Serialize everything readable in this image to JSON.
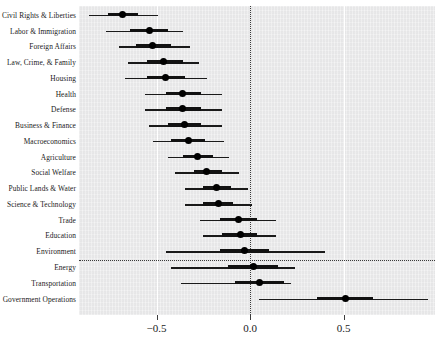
{
  "chart_data": {
    "type": "scatter",
    "plot_style": "coefficient-plot-with-confidence-intervals",
    "title": "",
    "subtitle": "",
    "xlabel": "",
    "ylabel": "",
    "xlim": [
      -0.75,
      0.98
    ],
    "xticks": [
      -0.5,
      0.0,
      0.5
    ],
    "xticklabels": [
      "−0.5",
      "0.0",
      "0.5"
    ],
    "grid": {
      "vertical_white_gridlines": true,
      "zero_reference_line": "dotted"
    },
    "legend": {
      "visible": false
    },
    "annotations": [
      {
        "type": "hline",
        "style": "dotted",
        "between": [
          "Environment",
          "Energy"
        ]
      }
    ],
    "panel_background": "#ececed",
    "point_color": "#000000",
    "line_color": "#1a1a1a",
    "categories": [
      "Civil Rights & Liberties",
      "Labor & Immigration",
      "Foreign Affairs",
      "Law, Crime, & Family",
      "Housing",
      "Health",
      "Defense",
      "Business & Finance",
      "Macroeconomics",
      "Agriculture",
      "Social Welfare",
      "Public Lands & Water",
      "Science & Technology",
      "Trade",
      "Education",
      "Environment",
      "Energy",
      "Transportation",
      "Government Operations"
    ],
    "values": [
      -0.68,
      -0.54,
      -0.52,
      -0.46,
      -0.45,
      -0.36,
      -0.36,
      -0.35,
      -0.33,
      -0.28,
      -0.23,
      -0.18,
      -0.17,
      -0.06,
      -0.05,
      -0.03,
      0.02,
      0.05,
      0.51
    ],
    "ci_outer_low": [
      -0.86,
      -0.77,
      -0.7,
      -0.65,
      -0.67,
      -0.56,
      -0.56,
      -0.54,
      -0.52,
      -0.44,
      -0.4,
      -0.35,
      -0.35,
      -0.27,
      -0.25,
      -0.45,
      -0.42,
      -0.37,
      0.05
    ],
    "ci_outer_high": [
      -0.49,
      -0.36,
      -0.32,
      -0.27,
      -0.23,
      -0.15,
      -0.15,
      -0.15,
      -0.14,
      -0.11,
      -0.06,
      -0.01,
      0.01,
      0.14,
      0.14,
      0.4,
      0.24,
      0.22,
      0.95
    ],
    "ci_inner_low": [
      -0.76,
      -0.64,
      -0.61,
      -0.55,
      -0.55,
      -0.45,
      -0.45,
      -0.44,
      -0.42,
      -0.36,
      -0.3,
      -0.25,
      -0.25,
      -0.16,
      -0.15,
      -0.16,
      -0.12,
      -0.08,
      0.36
    ],
    "ci_inner_high": [
      -0.6,
      -0.44,
      -0.42,
      -0.36,
      -0.35,
      -0.26,
      -0.26,
      -0.26,
      -0.24,
      -0.2,
      -0.15,
      -0.1,
      -0.09,
      0.04,
      0.04,
      0.1,
      0.15,
      0.18,
      0.66
    ]
  }
}
